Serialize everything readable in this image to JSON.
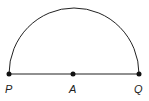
{
  "diagram": {
    "type": "semicircle",
    "points": [
      {
        "label": "P",
        "x": 9,
        "y": 74
      },
      {
        "label": "A",
        "x": 73,
        "y": 74
      },
      {
        "label": "Q",
        "x": 139,
        "y": 74
      }
    ],
    "colors": {
      "stroke": "#222222",
      "background": "#ffffff"
    }
  }
}
